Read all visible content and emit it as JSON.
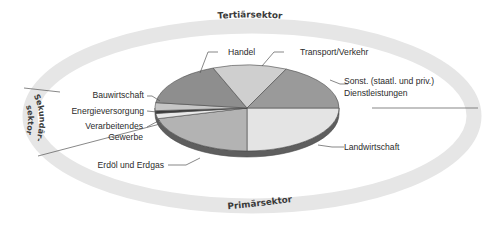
{
  "diagram": {
    "ring_labels": {
      "top": "Tertiärsektor",
      "bottom": "Primärsektor",
      "left_line1": "Sekundär-",
      "left_line2": "sektor"
    },
    "colors": {
      "ring": "#e6e6e6",
      "outline": "#4a4a4a",
      "edge": "#5e5e5e"
    }
  },
  "chart_data": {
    "type": "pie",
    "style": "3d-tilted-pie inside sector ring",
    "title": "",
    "groups": [
      {
        "name": "Tertiärsektor",
        "members": [
          "Handel",
          "Transport/Verkehr",
          "Sonst. (staatl. und priv.) Dienstleistungen"
        ]
      },
      {
        "name": "Sekundärsektor",
        "members": [
          "Bauwirtschaft",
          "Energieversorgung",
          "Verarbeitendes Gewerbe"
        ]
      },
      {
        "name": "Primärsektor",
        "members": [
          "Erdöl und Erdgas",
          "Landwirtschaft"
        ]
      }
    ],
    "slices": [
      {
        "label": "Landwirtschaft",
        "value": 25,
        "color": "#e4e4e4"
      },
      {
        "label": "Erdöl und Erdgas",
        "value": 21,
        "color": "#b3b3b3"
      },
      {
        "label": "Verarbeitendes Gewerbe",
        "value": 2,
        "color": "#e9e9e9"
      },
      {
        "label": "Energieversorgung",
        "value": 1,
        "color": "#3c3c3c"
      },
      {
        "label": "Bauwirtschaft",
        "value": 3,
        "color": "#c6c6c6"
      },
      {
        "label": "Handel",
        "value": 17,
        "color": "#8e8e8e"
      },
      {
        "label": "Transport/Verkehr",
        "value": 13,
        "color": "#cfcfcf"
      },
      {
        "label": "Sonst. (staatl. und priv.) Dienstleistungen",
        "value": 18,
        "color": "#9a9a9a"
      }
    ],
    "units": "approximate share (%), read from slice angles"
  },
  "labels": {
    "handel": "Handel",
    "transport": "Transport/Verkehr",
    "sonst_line1": "Sonst. (staatl. und priv.)",
    "sonst_line2": "Dienstleistungen",
    "bau": "Bauwirtschaft",
    "energie": "Energieversorgung",
    "verarb_line1": "Verarbeitendes",
    "verarb_line2": "Gewerbe",
    "erdoel": "Erdöl und Erdgas",
    "landwirtschaft": "Landwirtschaft"
  }
}
